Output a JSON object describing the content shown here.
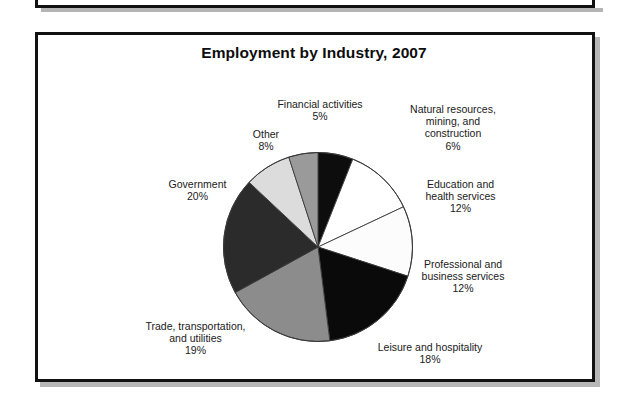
{
  "figure": {
    "title": "Employment by Industry, 2007"
  },
  "chart_data": {
    "type": "pie",
    "title": "Employment by Industry, 2007",
    "unit": "percent",
    "start_angle_deg": 0,
    "direction": "clockwise",
    "legend": "none",
    "labels_position": "outside-callout",
    "categories": [
      "Natural resources, mining, and construction",
      "Education and health services",
      "Professional and business services",
      "Leisure and hospitality",
      "Trade, transportation, and utilities",
      "Government",
      "Other",
      "Financial activities"
    ],
    "values": [
      6,
      12,
      12,
      18,
      19,
      20,
      8,
      5
    ],
    "slices": [
      {
        "name": "Natural resources, mining, and construction",
        "label_lines": [
          "Natural resources,",
          "mining, and",
          "construction"
        ],
        "value": 6,
        "value_text": "6%",
        "color": "#0d0d0d"
      },
      {
        "name": "Education and health services",
        "label_lines": [
          "Education and",
          "health services"
        ],
        "value": 12,
        "value_text": "12%",
        "color": "#ffffff"
      },
      {
        "name": "Professional and business services",
        "label_lines": [
          "Professional and",
          "business services"
        ],
        "value": 12,
        "value_text": "12%",
        "color": "#fcfcfc"
      },
      {
        "name": "Leisure and hospitality",
        "label_lines": [
          "Leisure and hospitality"
        ],
        "value": 18,
        "value_text": "18%",
        "color": "#0a0a0a"
      },
      {
        "name": "Trade, transportation, and utilities",
        "label_lines": [
          "Trade, transportation,",
          "and utilities"
        ],
        "value": 19,
        "value_text": "19%",
        "color": "#8c8c8c"
      },
      {
        "name": "Government",
        "label_lines": [
          "Government"
        ],
        "value": 20,
        "value_text": "20%",
        "color": "#2b2b2b"
      },
      {
        "name": "Other",
        "label_lines": [
          "Other"
        ],
        "value": 8,
        "value_text": "8%",
        "color": "#dcdcdc"
      },
      {
        "name": "Financial activities",
        "label_lines": [
          "Financial activities"
        ],
        "value": 5,
        "value_text": "5%",
        "color": "#9a9a9a"
      }
    ]
  },
  "labels": {
    "financial_activities": {
      "line1": "Financial activities",
      "pct": "5%"
    },
    "natural_resources": {
      "line1": "Natural resources,",
      "line2": "mining, and",
      "line3": "construction",
      "pct": "6%"
    },
    "education_health": {
      "line1": "Education and",
      "line2": "health services",
      "pct": "12%"
    },
    "professional_business": {
      "line1": "Professional and",
      "line2": "business services",
      "pct": "12%"
    },
    "leisure_hospitality": {
      "line1": "Leisure and hospitality",
      "pct": "18%"
    },
    "trade_transportation": {
      "line1": "Trade, transportation,",
      "line2": "and utilities",
      "pct": "19%"
    },
    "government": {
      "line1": "Government",
      "pct": "20%"
    },
    "other": {
      "line1": "Other",
      "pct": "8%"
    }
  },
  "colors": {
    "outline": "#3a3a3a",
    "frame": "#111111",
    "shadow": "#b7b7b7",
    "text": "#1a1a1a"
  }
}
